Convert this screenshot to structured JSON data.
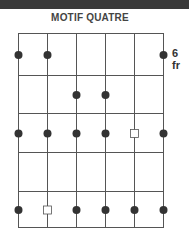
{
  "title": "MOTIF QUATRE",
  "fret_label": "6 fr",
  "colors": {
    "line": "#555555",
    "dot": "#333333",
    "bar": "#3a3a3a"
  },
  "strings": 6,
  "frets": 5,
  "markers": [
    {
      "fret": 1,
      "string": 1,
      "type": "dot"
    },
    {
      "fret": 1,
      "string": 2,
      "type": "dot"
    },
    {
      "fret": 1,
      "string": 6,
      "type": "dot"
    },
    {
      "fret": 2,
      "string": 3,
      "type": "dot"
    },
    {
      "fret": 2,
      "string": 4,
      "type": "dot"
    },
    {
      "fret": 3,
      "string": 1,
      "type": "dot"
    },
    {
      "fret": 3,
      "string": 2,
      "type": "dot"
    },
    {
      "fret": 3,
      "string": 3,
      "type": "dot"
    },
    {
      "fret": 3,
      "string": 4,
      "type": "dot"
    },
    {
      "fret": 3,
      "string": 5,
      "type": "square"
    },
    {
      "fret": 3,
      "string": 6,
      "type": "dot"
    },
    {
      "fret": 5,
      "string": 1,
      "type": "dot"
    },
    {
      "fret": 5,
      "string": 2,
      "type": "square"
    },
    {
      "fret": 5,
      "string": 3,
      "type": "dot"
    },
    {
      "fret": 5,
      "string": 4,
      "type": "dot"
    },
    {
      "fret": 5,
      "string": 5,
      "type": "dot"
    },
    {
      "fret": 5,
      "string": 6,
      "type": "dot"
    }
  ]
}
